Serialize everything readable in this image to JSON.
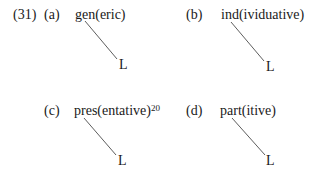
{
  "example_number": "(31)",
  "items": [
    {
      "label": "(a)",
      "word": "gen(eric)",
      "footnote": "",
      "node": "L"
    },
    {
      "label": "(b)",
      "word": "ind(ividuative)",
      "footnote": "",
      "node": "L"
    },
    {
      "label": "(c)",
      "word": "pres(entative)",
      "footnote": "20",
      "node": "L"
    },
    {
      "label": "(d)",
      "word": "part(itive)",
      "footnote": "",
      "node": "L"
    }
  ]
}
